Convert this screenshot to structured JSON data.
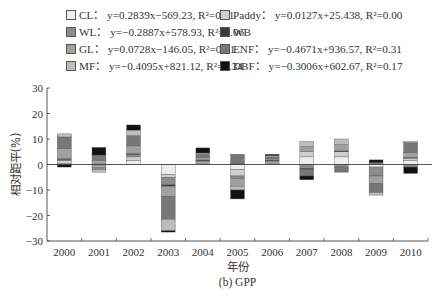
{
  "chart_data": {
    "type": "bar",
    "stacked": true,
    "title": "",
    "caption": "(b) GPP",
    "xlabel": "年份",
    "ylabel": "相对距平(%)",
    "ylim": [
      -30,
      30
    ],
    "yticks": [
      30,
      20,
      10,
      0,
      -10,
      -20,
      -30
    ],
    "ytick_labels": [
      "30",
      "20",
      "10",
      "0",
      "−10",
      "−20",
      "−30"
    ],
    "categories": [
      "2000",
      "2001",
      "2002",
      "2003",
      "2004",
      "2005",
      "2006",
      "2007",
      "2008",
      "2009",
      "2010"
    ],
    "legend_placement": "top",
    "legend": [
      {
        "key": "CL",
        "label": "CL：",
        "eq": "y=0.2839x−569.23, R²=0.11",
        "color": "#eeeeee"
      },
      {
        "key": "Paddy",
        "label": "Paddy：",
        "eq": "y=0.0127x+25.438, R²=0.00",
        "color": "#cfcfcf"
      },
      {
        "key": "WL",
        "label": "WL：",
        "eq": "y=−0.2887x+578.93, R²=0.06",
        "color": "#8c8c8c"
      },
      {
        "key": "WB",
        "label": "WB",
        "eq": "",
        "color": "#3a3a3a"
      },
      {
        "key": "GL",
        "label": "GL：",
        "eq": "y=0.0728x−146.05, R²=0.01",
        "color": "#a0a0a0"
      },
      {
        "key": "ENF",
        "label": "ENF：",
        "eq": "y=−0.4671x+936.57, R²=0.31",
        "color": "#777777"
      },
      {
        "key": "MF",
        "label": "MF：",
        "eq": "y=−0.4095x+821.12, R²=0.34",
        "color": "#bdbdbd"
      },
      {
        "key": "DBF",
        "label": "DBF：",
        "eq": "y=−0.3006x+602.67, R²=0.17",
        "color": "#111111"
      }
    ],
    "series": [
      {
        "name": "CL",
        "values": [
          0.5,
          -0.5,
          1.5,
          -4.0,
          0.5,
          -2.0,
          0.5,
          3.0,
          3.0,
          -1.0,
          1.5
        ]
      },
      {
        "name": "Paddy",
        "values": [
          1.0,
          -0.5,
          1.5,
          -1.0,
          0.5,
          -2.5,
          0.5,
          2.0,
          2.0,
          0.5,
          1.0
        ]
      },
      {
        "name": "WL",
        "values": [
          0.5,
          -1.0,
          1.0,
          -3.0,
          0.5,
          -1.0,
          0.5,
          -1.5,
          -1.0,
          -3.5,
          -1.0
        ]
      },
      {
        "name": "WB",
        "values": [
          0.3,
          0.2,
          0.3,
          -0.5,
          0.3,
          0.3,
          0.3,
          -0.5,
          0.3,
          0.3,
          0.3
        ]
      },
      {
        "name": "GL",
        "values": [
          4.0,
          1.5,
          3.0,
          -4.0,
          1.0,
          -3.0,
          0.5,
          2.0,
          2.5,
          -3.0,
          2.0
        ]
      },
      {
        "name": "ENF",
        "values": [
          4.5,
          2.0,
          4.0,
          -9.0,
          1.2,
          3.7,
          0.7,
          -2.5,
          -2.0,
          -3.5,
          3.7
        ]
      },
      {
        "name": "MF",
        "values": [
          1.2,
          -1.0,
          2.2,
          -4.5,
          0.5,
          -1.5,
          0.5,
          2.0,
          2.2,
          -1.0,
          0.5
        ]
      },
      {
        "name": "DBF",
        "values": [
          -1.0,
          3.0,
          2.0,
          -0.5,
          2.0,
          -3.5,
          0.5,
          -1.5,
          0,
          1.0,
          -2.5
        ]
      }
    ]
  }
}
